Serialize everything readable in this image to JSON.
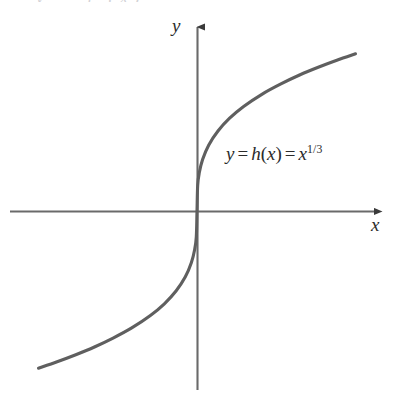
{
  "figure": {
    "background_color": "#ffffff",
    "curve_color": "#5f5f5f",
    "axis_color": "#6a6a6a",
    "text_color": "#2b2b2b",
    "clipped_top_text": "y = f (x)"
  },
  "labels": {
    "y_axis": "y",
    "x_axis": "x"
  },
  "equation": {
    "lhs": "y",
    "equals_1": "=",
    "func_name": "h",
    "open_paren": "(",
    "arg": "x",
    "close_paren": ")",
    "equals_2": "=",
    "base": "x",
    "exponent": "1/3",
    "full_text": "y = h(x) = x^1/3"
  },
  "chart_data": {
    "type": "line",
    "title": "",
    "subtitle": "",
    "xlabel": "x",
    "ylabel": "y",
    "legend": [
      "y = h(x) = x^1/3"
    ],
    "legend_position": "inline-right-of-curve",
    "grid": false,
    "axes_style": "arrow-ended cartesian axes through origin",
    "function": "h(x) = x^(1/3)",
    "annotations": [
      "y = h(x) = x^1/3"
    ],
    "xlim": [
      -3.4,
      3.4
    ],
    "ylim": [
      -1.55,
      1.55
    ],
    "origin_px": [
      197,
      211
    ],
    "series": [
      {
        "name": "y = h(x) = x^1/3",
        "x": [
          -3.4,
          -3.0,
          -2.6,
          -2.2,
          -1.8,
          -1.4,
          -1.0,
          -0.7,
          -0.45,
          -0.25,
          -0.12,
          -0.05,
          -0.015,
          0,
          0.015,
          0.05,
          0.12,
          0.25,
          0.45,
          0.7,
          1.0,
          1.4,
          1.8,
          2.2,
          2.6,
          3.0,
          3.4
        ],
        "y": [
          -1.504,
          -1.442,
          -1.375,
          -1.301,
          -1.216,
          -1.119,
          -1.0,
          -0.888,
          -0.766,
          -0.63,
          -0.493,
          -0.368,
          -0.247,
          0,
          0.247,
          0.368,
          0.493,
          0.63,
          0.766,
          0.888,
          1.0,
          1.119,
          1.216,
          1.301,
          1.375,
          1.442,
          1.504
        ]
      }
    ]
  }
}
